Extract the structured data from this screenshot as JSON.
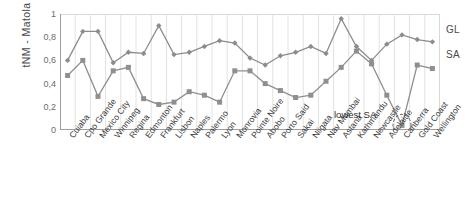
{
  "chart_data": {
    "type": "line",
    "title": "",
    "xlabel": "",
    "ylabel": "tNM - Matola",
    "ylim": [
      0,
      1
    ],
    "yticks": [
      "0",
      "0,2",
      "0,4",
      "0,6",
      "0,8",
      "1"
    ],
    "ytick_values": [
      0,
      0.2,
      0.4,
      0.6,
      0.8,
      1
    ],
    "grid": "vertical",
    "legend_position": "right",
    "categories": [
      "Cuiaba",
      "Cpo Grande",
      "Mexico City",
      "Winnipeg",
      "Regina",
      "Edmonton",
      "Frankfurt",
      "Lisbon",
      "Naples",
      "Palermo",
      "Lyon",
      "Monrovia",
      "Pointe Noire",
      "Abobo",
      "Porto Said",
      "Sakai",
      "Niigata",
      "Nav Mumbai",
      "Astana",
      "Kathmandu",
      "Newcastle",
      "Adelaide",
      "Canberra",
      "Gold Coast",
      "Wellington"
    ],
    "series": [
      {
        "name": "GL",
        "marker": "diamond",
        "color": "#8c8c8c",
        "values": [
          0.6,
          0.85,
          0.85,
          0.58,
          0.67,
          0.66,
          0.9,
          0.65,
          0.67,
          0.72,
          0.77,
          0.75,
          0.62,
          0.56,
          0.64,
          0.67,
          0.72,
          0.66,
          0.96,
          0.72,
          0.6,
          0.74,
          0.82,
          0.78,
          0.76
        ]
      },
      {
        "name": "SA",
        "marker": "square",
        "color": "#8f8f8f",
        "values": [
          0.47,
          0.6,
          0.29,
          0.51,
          0.54,
          0.27,
          0.22,
          0.24,
          0.33,
          0.3,
          0.24,
          0.51,
          0.51,
          0.4,
          0.34,
          0.28,
          0.3,
          0.42,
          0.54,
          0.68,
          0.57,
          0.3,
          0.04,
          0.56,
          0.53
        ]
      }
    ],
    "annotations": [
      {
        "text": "lowest SA",
        "target_category": "Canberra",
        "target_series": "SA",
        "target_value": 0.04
      }
    ]
  },
  "legend": {
    "items": [
      {
        "label": "GL"
      },
      {
        "label": "SA"
      }
    ]
  }
}
